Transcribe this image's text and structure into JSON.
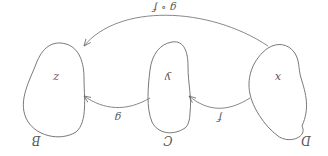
{
  "diagram": {
    "orientation": "rotated-180",
    "sets": [
      {
        "name": "D",
        "element": "x"
      },
      {
        "name": "C",
        "element": "y"
      },
      {
        "name": "B",
        "element": "z"
      }
    ],
    "arrows": [
      {
        "label": "f",
        "from": "x",
        "to": "y"
      },
      {
        "label": "g",
        "from": "y",
        "to": "z"
      },
      {
        "label": "g ∘ f",
        "from": "x",
        "to": "z"
      }
    ],
    "colors": {
      "stroke": "#6a6a6a",
      "text": "#555555",
      "background": "#ffffff"
    }
  }
}
